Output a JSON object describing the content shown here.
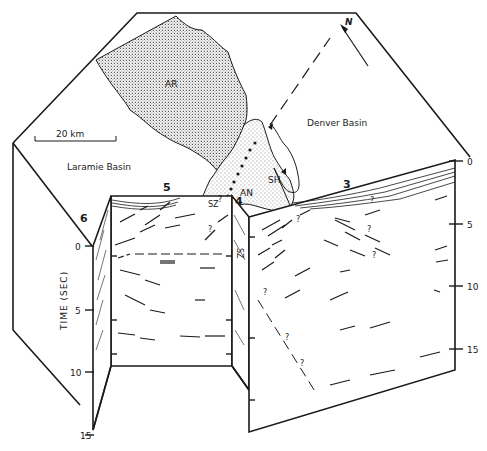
{
  "figure": {
    "type": "geologic block diagram",
    "map_surface": {
      "regions": [
        {
          "id": "AR",
          "label": "AR",
          "fill": "stipple-dense"
        },
        {
          "id": "AN",
          "label": "AN",
          "fill": "stipple-light"
        },
        {
          "id": "SH",
          "label": "SH",
          "fill": "none"
        }
      ],
      "basins": {
        "laramie": "Laramie Basin",
        "denver": "Denver Basin"
      },
      "scale_bar": {
        "label": "20 km"
      },
      "north_arrow": {
        "label": "N"
      }
    },
    "profiles": {
      "p3": "3",
      "p4": "4",
      "p5": "5",
      "p6": "6"
    },
    "annotations": {
      "sz": "SZ",
      "question": "?"
    },
    "left_axis": {
      "title": "TIME (SEC)",
      "ticks": [
        "0",
        "5",
        "10",
        "15"
      ]
    },
    "right_axis": {
      "ticks": [
        "0",
        "5",
        "10",
        "15"
      ]
    }
  },
  "colors": {
    "ink": "#1a1a1a",
    "background": "#ffffff"
  }
}
